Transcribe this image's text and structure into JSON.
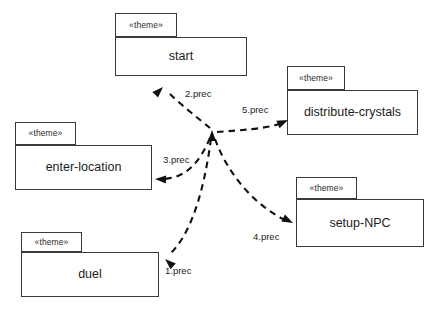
{
  "diagram": {
    "stereotype": "«theme»",
    "stroke_color": "#3a3a3a",
    "edge_color": "#111111",
    "background": "#ffffff"
  },
  "packages": [
    {
      "id": "start",
      "name": "start",
      "stereotype": "«theme»",
      "tab": {
        "x": 115,
        "y": 13,
        "w": 62,
        "h": 24
      },
      "body": {
        "x": 115,
        "y": 37,
        "w": 132,
        "h": 39
      }
    },
    {
      "id": "distribute-crystals",
      "name": "distribute-crystals",
      "stereotype": "«theme»",
      "tab": {
        "x": 287,
        "y": 66,
        "w": 58,
        "h": 24
      },
      "body": {
        "x": 287,
        "y": 90,
        "w": 131,
        "h": 45
      }
    },
    {
      "id": "enter-location",
      "name": "enter-location",
      "stereotype": "«theme»",
      "tab": {
        "x": 15,
        "y": 122,
        "w": 61,
        "h": 23
      },
      "body": {
        "x": 15,
        "y": 145,
        "w": 137,
        "h": 45
      }
    },
    {
      "id": "setup-npc",
      "name": "setup-NPC",
      "stereotype": "«theme»",
      "tab": {
        "x": 296,
        "y": 177,
        "w": 61,
        "h": 22
      },
      "body": {
        "x": 296,
        "y": 199,
        "w": 128,
        "h": 48
      }
    },
    {
      "id": "duel",
      "name": "duel",
      "stereotype": "«theme»",
      "tab": {
        "x": 21,
        "y": 232,
        "w": 61,
        "h": 20
      },
      "body": {
        "x": 21,
        "y": 252,
        "w": 138,
        "h": 45
      }
    }
  ],
  "hub": {
    "x": 213,
    "y": 133
  },
  "edges": [
    {
      "id": "edge-1",
      "label": "1.prec",
      "target": "duel",
      "label_pos": {
        "x": 165,
        "y": 266
      },
      "path": "M 211 139 C 206 175 196 228 171 253",
      "head": {
        "x": 165,
        "y": 259,
        "angle": 222
      }
    },
    {
      "id": "edge-2",
      "label": "2.prec",
      "target": "start",
      "label_pos": {
        "x": 185,
        "y": 89
      },
      "path": "M 210 128 C 199 119 181 105 169 93",
      "head": {
        "x": 163,
        "y": 87,
        "angle": 315
      }
    },
    {
      "id": "edge-3",
      "label": "3.prec",
      "target": "enter-location",
      "label_pos": {
        "x": 163,
        "y": 155
      },
      "path": "M 210 138 C 201 158 190 177 164 179",
      "head": {
        "x": 155,
        "y": 179,
        "angle": 182
      }
    },
    {
      "id": "edge-4",
      "label": "4.prec",
      "target": "setup-npc",
      "label_pos": {
        "x": 253,
        "y": 232
      },
      "path": "M 215 139 C 227 172 252 203 283 219",
      "head": {
        "x": 293,
        "y": 223,
        "angle": 27
      }
    },
    {
      "id": "edge-5",
      "label": "5.prec",
      "target": "distribute-crystals",
      "label_pos": {
        "x": 242,
        "y": 105
      },
      "path": "M 217 132 C 241 130 264 129 279 124",
      "head": {
        "x": 288,
        "y": 120,
        "angle": 336
      }
    },
    {
      "id": "edge-hub",
      "label": "",
      "target": "hub",
      "label_pos": null,
      "path": "",
      "head": {
        "x": 212,
        "y": 130,
        "angle": 270
      }
    }
  ]
}
